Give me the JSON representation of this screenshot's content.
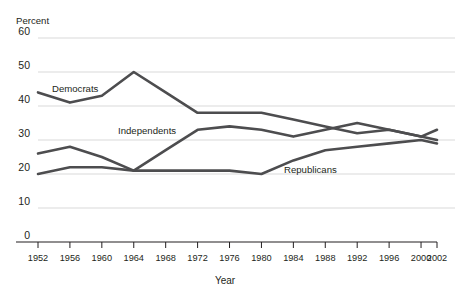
{
  "chart_data": {
    "type": "line",
    "title": "",
    "xlabel": "Year",
    "ylabel": "Percent",
    "unit_label": "Percent",
    "categories": [
      1952,
      1956,
      1960,
      1964,
      1968,
      1972,
      1976,
      1980,
      1984,
      1988,
      1992,
      1996,
      2000,
      2002
    ],
    "xtick_labels": [
      "1952",
      "1956",
      "1960",
      "1964",
      "1968",
      "1972",
      "1976",
      "1980",
      "1984",
      "1988",
      "1992",
      "1996",
      "2000",
      "2002"
    ],
    "ytick_labels": [
      "0",
      "10",
      "20",
      "30",
      "40",
      "50",
      "60"
    ],
    "ylim": [
      0,
      60
    ],
    "yticks": [
      0,
      10,
      20,
      30,
      40,
      50,
      60
    ],
    "grid": true,
    "legend_position": "inline-labels",
    "series": [
      {
        "name": "Democrats",
        "label": "Democrats",
        "color": "#4d4d4f",
        "values": [
          44,
          41,
          43,
          50,
          44,
          38,
          38,
          38,
          36,
          34,
          32,
          33,
          31,
          30
        ]
      },
      {
        "name": "Independents",
        "label": "Independents",
        "color": "#4d4d4f",
        "values": [
          20,
          22,
          22,
          21,
          27,
          33,
          34,
          33,
          31,
          33,
          35,
          33,
          31,
          33
        ]
      },
      {
        "name": "Republicans",
        "label": "Republicans",
        "color": "#4d4d4f",
        "values": [
          26,
          28,
          25,
          21,
          21,
          21,
          21,
          20,
          24,
          27,
          28,
          29,
          30,
          29
        ]
      }
    ]
  },
  "axes": {
    "y_unit": "Percent",
    "x_title": "Year"
  },
  "series_labels": {
    "democrats": "Democrats",
    "independents": "Independents",
    "republicans": "Republicans"
  },
  "colors": {
    "line": "#4d4d4f",
    "grid": "#d9d9d9",
    "axis": "#231f20",
    "background": "#ffffff"
  }
}
